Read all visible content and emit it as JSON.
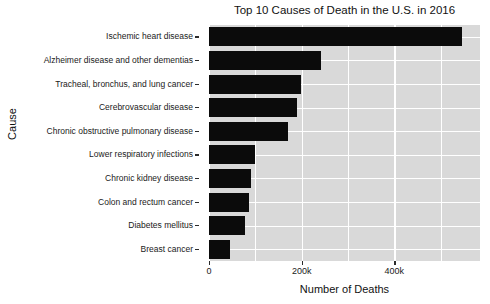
{
  "chart_data": {
    "type": "bar",
    "orientation": "horizontal",
    "title": "Top 10 Causes of Death in the U.S. in 2016",
    "xlabel": "Number of Deaths",
    "ylabel": "Cause",
    "categories": [
      "Ischemic heart disease",
      "Alzheimer disease and other dementias",
      "Tracheal, bronchus, and lung cancer",
      "Cerebrovascular disease",
      "Chronic obstructive pulmonary disease",
      "Lower respiratory infections",
      "Chronic kidney disease",
      "Colon and rectum cancer",
      "Diabetes mellitus",
      "Breast cancer"
    ],
    "values": [
      547000,
      242000,
      199000,
      190000,
      171000,
      99000,
      91000,
      86000,
      78000,
      45000
    ],
    "xlim": [
      0,
      585000
    ],
    "xticks": [
      0,
      200000,
      400000
    ],
    "xtick_labels": [
      "0",
      "200k",
      "400k"
    ],
    "minor_xticks": [
      100000,
      300000,
      500000
    ],
    "grid": true,
    "legend": null,
    "style": {
      "plot_background": "#d9d9d9",
      "grid_color": "#ffffff",
      "bar_color": "#0b0b0b",
      "figure_background": "#ffffff",
      "text_color": "#1a1a1a"
    }
  }
}
